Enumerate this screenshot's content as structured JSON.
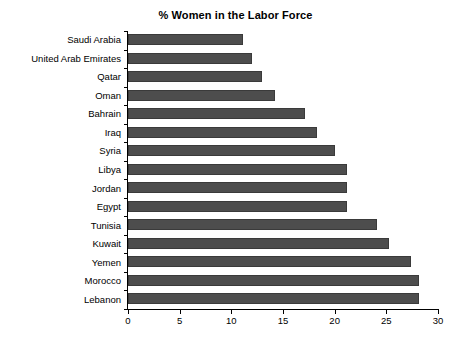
{
  "chart_data": {
    "type": "bar",
    "orientation": "horizontal",
    "title": "% Women in the Labor Force",
    "xlabel": "",
    "ylabel": "",
    "xlim": [
      0,
      30
    ],
    "xticks": [
      0,
      5,
      10,
      15,
      20,
      25,
      30
    ],
    "xtick_labels": [
      "0",
      "5",
      "10",
      "15",
      "20",
      "25",
      "30"
    ],
    "grid": false,
    "legend": false,
    "bar_color": "#4d4d4d",
    "background_color": "#ffffff",
    "axis_color": "#000000",
    "categories": [
      "Saudi Arabia",
      "United Arab Emirates",
      "Qatar",
      "Oman",
      "Bahrain",
      "Iraq",
      "Syria",
      "Libya",
      "Jordan",
      "Egypt",
      "Tunisia",
      "Kuwait",
      "Yemen",
      "Morocco",
      "Lebanon"
    ],
    "values": [
      11.1,
      12.0,
      13.0,
      14.2,
      17.1,
      18.3,
      20.0,
      21.2,
      21.2,
      21.2,
      24.1,
      25.3,
      27.4,
      28.2,
      28.2
    ],
    "series": [
      {
        "name": "% Women in the Labor Force",
        "values": [
          11.1,
          12.0,
          13.0,
          14.2,
          17.1,
          18.3,
          20.0,
          21.2,
          21.2,
          21.2,
          24.1,
          25.3,
          27.4,
          28.2,
          28.2
        ]
      }
    ]
  }
}
